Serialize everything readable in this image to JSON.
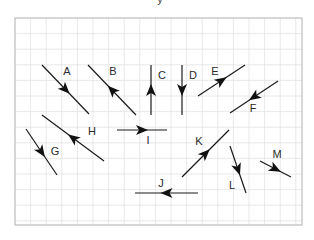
{
  "diagram": {
    "top_fragment": "y",
    "frame": {
      "x": 15,
      "y": 18,
      "width": 287,
      "height": 207
    },
    "grid": {
      "cell": 15.6,
      "line_color": "#e2e2e2",
      "frame_color": "#bdbdbd"
    },
    "vectors": [
      {
        "label": "A",
        "from": [
          42,
          65
        ],
        "to": [
          89,
          114
        ],
        "direction": "down-right",
        "label_pos": [
          67,
          72
        ]
      },
      {
        "label": "B",
        "from": [
          136,
          115
        ],
        "to": [
          88,
          65
        ],
        "direction": "up-left",
        "label_pos": [
          113,
          72
        ]
      },
      {
        "label": "C",
        "from": [
          151,
          115
        ],
        "to": [
          151,
          65
        ],
        "direction": "up",
        "label_pos": [
          162,
          76
        ]
      },
      {
        "label": "D",
        "from": [
          182,
          65
        ],
        "to": [
          182,
          115
        ],
        "direction": "down",
        "label_pos": [
          193,
          76
        ]
      },
      {
        "label": "E",
        "from": [
          198,
          96
        ],
        "to": [
          245,
          65
        ],
        "direction": "up-right",
        "label_pos": [
          215,
          72
        ]
      },
      {
        "label": "F",
        "from": [
          278,
          81
        ],
        "to": [
          230,
          113
        ],
        "direction": "down-left",
        "label_pos": [
          253,
          109
        ]
      },
      {
        "label": "G",
        "from": [
          26,
          129
        ],
        "to": [
          57,
          175
        ],
        "direction": "down-right",
        "label_pos": [
          55,
          152
        ]
      },
      {
        "label": "H",
        "from": [
          104,
          161
        ],
        "to": [
          42,
          115
        ],
        "direction": "up-left",
        "label_pos": [
          92,
          132
        ]
      },
      {
        "label": "I",
        "from": [
          117,
          130
        ],
        "to": [
          167,
          130
        ],
        "direction": "right",
        "label_pos": [
          148,
          141
        ]
      },
      {
        "label": "J",
        "from": [
          198,
          193
        ],
        "to": [
          135,
          193
        ],
        "direction": "left",
        "label_pos": [
          161,
          184
        ]
      },
      {
        "label": "K",
        "from": [
          182,
          177
        ],
        "to": [
          229,
          130
        ],
        "direction": "up-right",
        "label_pos": [
          199,
          142
        ]
      },
      {
        "label": "L",
        "from": [
          230,
          146
        ],
        "to": [
          246,
          193
        ],
        "direction": "down",
        "label_pos": [
          232,
          186
        ]
      },
      {
        "label": "M",
        "from": [
          260,
          161
        ],
        "to": [
          291,
          177
        ],
        "direction": "down-right",
        "label_pos": [
          277,
          155
        ]
      }
    ],
    "colors": {
      "vector": "#1a1a1a",
      "label": "#2a2a2a"
    }
  }
}
